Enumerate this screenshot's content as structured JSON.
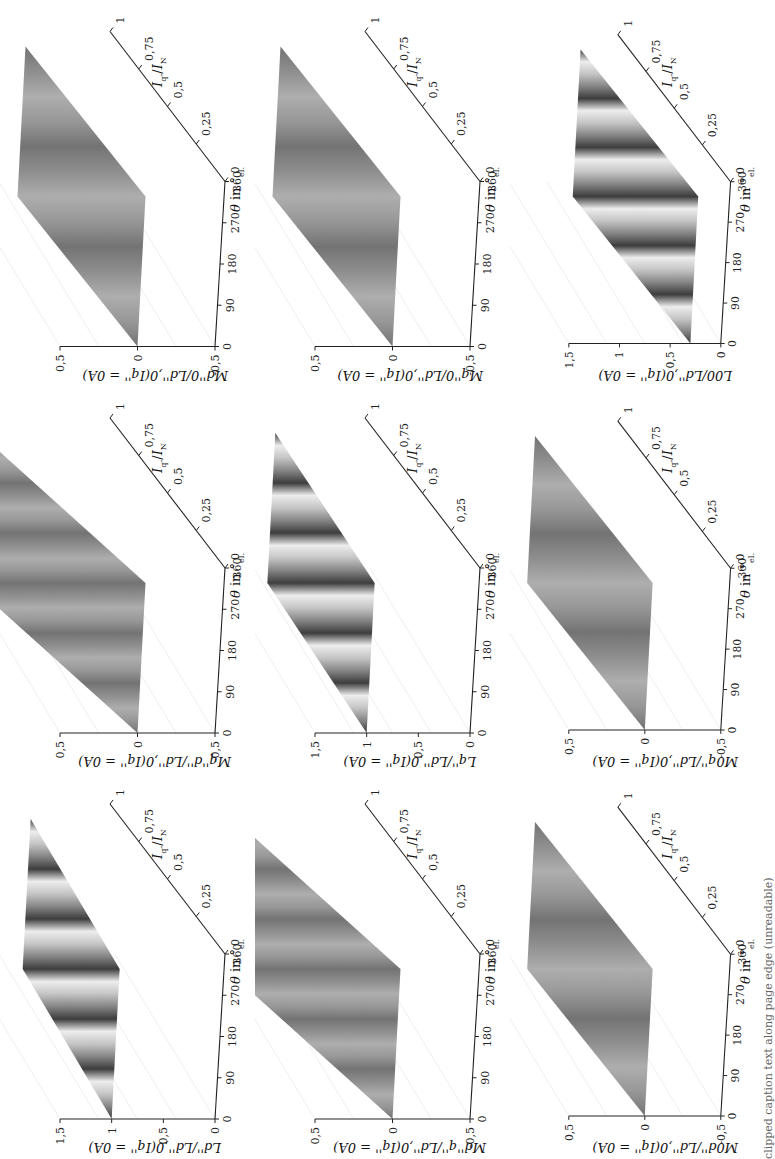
{
  "page": {
    "orientation": "rotated-90-ccw",
    "caption_visible": "clipped caption text along page edge (unreadable)"
  },
  "axes_common": {
    "theta_label": "θ in °el.",
    "theta_ticks": [
      "0",
      "90",
      "180",
      "270",
      "360"
    ],
    "iq_label": "Iq''/IN",
    "iq_ticks": [
      "0",
      "0,25",
      "0,5",
      "0,75",
      "1"
    ]
  },
  "chart_data": [
    {
      "type": "surface3d",
      "id": "Ld",
      "zlabel": "Ld''/Ld'',0(Iq'' = 0A)",
      "xlabel": "θ in °el.",
      "ylabel": "Iq''/IN",
      "x_ticks": [
        0,
        90,
        180,
        270,
        360
      ],
      "y_ticks": [
        0,
        0.25,
        0.5,
        0.75,
        1
      ],
      "z_ticks": [
        0,
        0.5,
        1,
        1.5
      ],
      "zlim": [
        0,
        1.5
      ],
      "description": "Ripple surface ~1 at Iq=0, decreasing with Iq; ~6 periodic stripes over θ",
      "approx_values": {
        "at_Iq_0": 1.0,
        "at_Iq_1": 0.7,
        "ripple_periods": 6
      }
    },
    {
      "type": "surface3d",
      "id": "Mqd",
      "zlabel": "Mq''d''/Ld'',0(Iq'' = 0A)",
      "xlabel": "θ in °el.",
      "ylabel": "Iq''/IN",
      "x_ticks": [
        0,
        90,
        180,
        270,
        360
      ],
      "y_ticks": [
        0,
        0.25,
        0.5,
        0.75,
        1
      ],
      "z_ticks": [
        -0.5,
        0,
        0.5
      ],
      "zlim": [
        -0.5,
        0.5
      ],
      "description": "Cross-coupling surface near 0 with periodic stripes, growing with Iq",
      "approx_values": {
        "at_Iq_0": 0.0,
        "at_Iq_1": 0.3,
        "ripple_periods": 6
      }
    },
    {
      "type": "surface3d",
      "id": "Md0",
      "zlabel": "Md''0/Ld'',0(Iq'' = 0A)",
      "xlabel": "θ in °el.",
      "ylabel": "Iq''/IN",
      "x_ticks": [
        0,
        90,
        180,
        270,
        360
      ],
      "y_ticks": [
        0,
        0.25,
        0.5,
        0.75,
        1
      ],
      "z_ticks": [
        -0.5,
        0,
        0.5
      ],
      "zlim": [
        -0.5,
        0.5
      ],
      "description": "Flat surface near 0 with small ripple",
      "approx_values": {
        "at_Iq_0": 0.0,
        "at_Iq_1": 0.0,
        "ripple_periods": 3
      }
    },
    {
      "type": "surface3d",
      "id": "Mdq",
      "zlabel": "Md''q''/Ld'',0(Iq'' = 0A)",
      "xlabel": "θ in °el.",
      "ylabel": "Iq''/IN",
      "x_ticks": [
        0,
        90,
        180,
        270,
        360
      ],
      "y_ticks": [
        0,
        0.25,
        0.5,
        0.75,
        1
      ],
      "z_ticks": [
        -0.5,
        0,
        0.5
      ],
      "zlim": [
        -0.5,
        0.5
      ],
      "description": "Cross-coupling surface near 0 with periodic stripes, growing with Iq",
      "approx_values": {
        "at_Iq_0": 0.0,
        "at_Iq_1": 0.3,
        "ripple_periods": 6
      }
    },
    {
      "type": "surface3d",
      "id": "Lq",
      "zlabel": "Lq''/Ld'',0(Iq'' = 0A)",
      "xlabel": "θ in °el.",
      "ylabel": "Iq''/IN",
      "x_ticks": [
        0,
        90,
        180,
        270,
        360
      ],
      "y_ticks": [
        0,
        0.25,
        0.5,
        0.75,
        1
      ],
      "z_ticks": [
        0,
        0.5,
        1,
        1.5
      ],
      "zlim": [
        0,
        1.5
      ],
      "description": "Surface ~1 at Iq=0 decreasing with Iq; periodic stripes",
      "approx_values": {
        "at_Iq_0": 1.0,
        "at_Iq_1": 0.8,
        "ripple_periods": 6
      }
    },
    {
      "type": "surface3d",
      "id": "Mq0",
      "zlabel": "Mq''0/Ld'',0(Iq'' = 0A)",
      "xlabel": "θ in °el.",
      "ylabel": "Iq''/IN",
      "x_ticks": [
        0,
        90,
        180,
        270,
        360
      ],
      "y_ticks": [
        0,
        0.25,
        0.5,
        0.75,
        1
      ],
      "z_ticks": [
        -0.5,
        0,
        0.5
      ],
      "zlim": [
        -0.5,
        0.5
      ],
      "description": "Flat surface near 0 with small ripple",
      "approx_values": {
        "at_Iq_0": 0.0,
        "at_Iq_1": 0.0,
        "ripple_periods": 3
      }
    },
    {
      "type": "surface3d",
      "id": "M0d",
      "zlabel": "M0d''/Ld'',0(Iq'' = 0A)",
      "xlabel": "θ in °el.",
      "ylabel": "Iq''/IN",
      "x_ticks": [
        0,
        90,
        180,
        270,
        360
      ],
      "y_ticks": [
        0,
        0.25,
        0.5,
        0.75,
        1
      ],
      "z_ticks": [
        -0.5,
        0,
        0.5
      ],
      "zlim": [
        -0.5,
        0.5
      ],
      "description": "Flat surface near 0 with small ripple",
      "approx_values": {
        "at_Iq_0": 0.0,
        "at_Iq_1": 0.0,
        "ripple_periods": 3
      }
    },
    {
      "type": "surface3d",
      "id": "M0q",
      "zlabel": "M0q''/Ld'',0(Iq'' = 0A)",
      "xlabel": "θ in °el.",
      "ylabel": "Iq''/IN",
      "x_ticks": [
        0,
        90,
        180,
        270,
        360
      ],
      "y_ticks": [
        0,
        0.25,
        0.5,
        0.75,
        1
      ],
      "z_ticks": [
        -0.5,
        0,
        0.5
      ],
      "zlim": [
        -0.5,
        0.5
      ],
      "description": "Flat surface near 0 with small ripple",
      "approx_values": {
        "at_Iq_0": 0.0,
        "at_Iq_1": 0.0,
        "ripple_periods": 3
      }
    },
    {
      "type": "surface3d",
      "id": "L00",
      "zlabel": "L00/Ld'',0(Iq'' = 0A)",
      "xlabel": "θ in °el.",
      "ylabel": "Iq''/IN",
      "x_ticks": [
        0,
        90,
        180,
        270,
        360
      ],
      "y_ticks": [
        0,
        0.25,
        0.5,
        0.75,
        1
      ],
      "z_ticks": [
        0,
        0.5,
        1,
        1.5
      ],
      "zlim": [
        0,
        1.5
      ],
      "description": "Low-level surface with light periodic stripes",
      "approx_values": {
        "at_Iq_0": 0.3,
        "at_Iq_1": 0.3,
        "ripple_periods": 6
      }
    }
  ]
}
